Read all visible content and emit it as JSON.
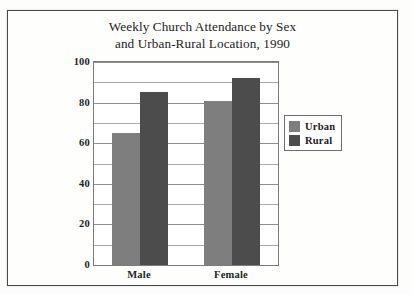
{
  "figure": {
    "title_line_1": "Weekly Church Attendance by Sex",
    "title_line_2": "and Urban-Rural Location, 1990"
  },
  "colors": {
    "urban": "#7e7e7e",
    "rural": "#4c4c4c",
    "frame": "#4a4a4a",
    "gridline": "#8e8e8e",
    "page_background": "#fdfdfc"
  },
  "legend": {
    "position": "right",
    "entries": [
      {
        "label": "Urban",
        "color": "#7e7e7e"
      },
      {
        "label": "Rural",
        "color": "#4c4c4c"
      }
    ]
  },
  "chart_data": {
    "type": "bar",
    "title": "Weekly Church Attendance by Sex and Urban-Rural Location, 1990",
    "xlabel": "",
    "ylabel": "",
    "categories": [
      "Male",
      "Female"
    ],
    "series": [
      {
        "name": "Urban",
        "values": [
          65,
          81
        ],
        "color": "#7e7e7e"
      },
      {
        "name": "Rural",
        "values": [
          85,
          92
        ],
        "color": "#4c4c4c"
      }
    ],
    "ylim": [
      0,
      100
    ],
    "ytick_labels": [
      "0",
      "20",
      "40",
      "60",
      "80",
      "100"
    ],
    "ytick_values": [
      0,
      20,
      40,
      60,
      80,
      100
    ],
    "minor_gridline_values": [
      10,
      30,
      50,
      70,
      90
    ],
    "grid": true,
    "legend_position": "right"
  }
}
